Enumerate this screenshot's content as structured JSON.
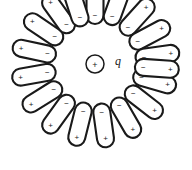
{
  "figure": {
    "name": "polarized-dipoles-around-point-charge",
    "width": 192,
    "height": 170,
    "background_color": "#ffffff",
    "stroke_color": "#1a1a1a"
  },
  "center_charge": {
    "label": "q",
    "sign": "+",
    "cx": 95,
    "cy": 64,
    "r": 9,
    "label_x": 118,
    "label_y": 61
  },
  "dipole_defaults": {
    "inner_sign": "−",
    "outer_sign": "+",
    "length": 44,
    "width": 17
  },
  "dipoles": [
    {
      "id": "dipole-01",
      "angle_deg": -90,
      "radius": 62,
      "length": 44,
      "width": 17,
      "inner_sign": "−",
      "outer_sign": "+"
    },
    {
      "id": "dipole-02",
      "angle_deg": -70,
      "radius": 64,
      "length": 44,
      "width": 17,
      "inner_sign": "−",
      "outer_sign": "+"
    },
    {
      "id": "dipole-03",
      "angle_deg": -48,
      "radius": 63,
      "length": 44,
      "width": 17,
      "inner_sign": "−",
      "outer_sign": "+"
    },
    {
      "id": "dipole-04",
      "angle_deg": -28,
      "radius": 62,
      "length": 44,
      "width": 17,
      "inner_sign": "−",
      "outer_sign": "+"
    },
    {
      "id": "dipole-05",
      "angle_deg": -8,
      "radius": 63,
      "length": 44,
      "width": 17,
      "inner_sign": "−",
      "outer_sign": "+"
    },
    {
      "id": "dipole-06",
      "angle_deg": 16,
      "radius": 62,
      "length": 44,
      "width": 17,
      "inner_sign": "−",
      "outer_sign": "+"
    },
    {
      "id": "dipole-07",
      "angle_deg": 38,
      "radius": 62,
      "length": 44,
      "width": 17,
      "inner_sign": "−",
      "outer_sign": "+"
    },
    {
      "id": "dipole-08",
      "angle_deg": 60,
      "radius": 62,
      "length": 44,
      "width": 17,
      "inner_sign": "−",
      "outer_sign": "+"
    },
    {
      "id": "dipole-09",
      "angle_deg": 82,
      "radius": 62,
      "length": 44,
      "width": 17,
      "inner_sign": "−",
      "outer_sign": "+"
    },
    {
      "id": "dipole-10",
      "angle_deg": 104,
      "radius": 62,
      "length": 44,
      "width": 17,
      "inner_sign": "−",
      "outer_sign": "+"
    },
    {
      "id": "dipole-11",
      "angle_deg": 126,
      "radius": 62,
      "length": 44,
      "width": 17,
      "inner_sign": "−",
      "outer_sign": "+"
    },
    {
      "id": "dipole-12",
      "angle_deg": 148,
      "radius": 62,
      "length": 44,
      "width": 17,
      "inner_sign": "−",
      "outer_sign": "+"
    },
    {
      "id": "dipole-13",
      "angle_deg": 170,
      "radius": 62,
      "length": 44,
      "width": 17,
      "inner_sign": "−",
      "outer_sign": "+"
    },
    {
      "id": "dipole-14",
      "angle_deg": -168,
      "radius": 62,
      "length": 44,
      "width": 17,
      "inner_sign": "−",
      "outer_sign": "+"
    },
    {
      "id": "dipole-15",
      "angle_deg": -146,
      "radius": 62,
      "length": 44,
      "width": 17,
      "inner_sign": "−",
      "outer_sign": "+"
    },
    {
      "id": "dipole-16",
      "angle_deg": -126,
      "radius": 62,
      "length": 44,
      "width": 17,
      "inner_sign": "−",
      "outer_sign": "+"
    },
    {
      "id": "dipole-17",
      "angle_deg": -108,
      "radius": 62,
      "length": 44,
      "width": 17,
      "inner_sign": "−",
      "outer_sign": "+"
    },
    {
      "id": "dipole-18",
      "angle_deg": 4,
      "radius": 62,
      "length": 44,
      "width": 17,
      "inner_sign": "−",
      "outer_sign": "+"
    }
  ]
}
